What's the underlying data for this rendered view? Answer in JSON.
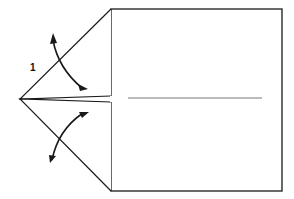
{
  "diagram": {
    "type": "origami-fold-step",
    "step_number": "1",
    "colors": {
      "line": "#1a1a1a",
      "background": "#ffffff",
      "crease": "#777777"
    },
    "elements": [
      {
        "name": "square-paper",
        "description": "Square sheet"
      },
      {
        "name": "upper-flap",
        "description": "Upper triangular flap folded to the left point"
      },
      {
        "name": "lower-flap",
        "description": "Lower triangular flap folded to the left point"
      },
      {
        "name": "center-crease",
        "description": "Horizontal center crease line"
      },
      {
        "name": "fold-arrow-upper",
        "description": "Curved arrow indicating upper flap fold"
      },
      {
        "name": "fold-arrow-lower",
        "description": "Curved arrow indicating lower flap fold"
      }
    ]
  }
}
